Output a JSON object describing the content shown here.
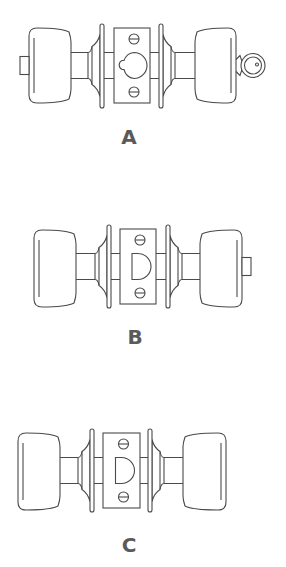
{
  "colors": {
    "background": "#ffffff",
    "line": "#4a4a4a",
    "label": "#5a5a5a"
  },
  "figures": [
    {
      "id": "A",
      "label": "A",
      "description": "keyed entry knob lockset",
      "left_accessory": "turn-button",
      "right_accessory": "key",
      "latch_hole": "round",
      "left_knob": {
        "x1": 29,
        "x2": 71,
        "top": 28,
        "bottom": 103
      },
      "left_rose": {
        "x": 100,
        "top": 24,
        "bottom": 108
      },
      "plate": {
        "x1": 114,
        "x2": 150,
        "top": 28,
        "bottom": 103
      },
      "right_rose": {
        "x": 159,
        "top": 24,
        "bottom": 108
      },
      "right_knob": {
        "x1": 195,
        "x2": 236,
        "top": 28,
        "bottom": 103
      },
      "label_pos": {
        "x": 117,
        "y": 127
      }
    },
    {
      "id": "B",
      "label": "B",
      "description": "privacy knob lockset",
      "left_accessory": "none",
      "right_accessory": "turn-button",
      "latch_hole": "d-shape",
      "left_knob": {
        "x1": 34,
        "x2": 76,
        "top": 230,
        "bottom": 307
      },
      "left_rose": {
        "x": 107,
        "top": 225,
        "bottom": 308
      },
      "plate": {
        "x1": 120,
        "x2": 156,
        "top": 229,
        "bottom": 304
      },
      "right_rose": {
        "x": 166,
        "top": 225,
        "bottom": 308
      },
      "right_knob": {
        "x1": 200,
        "x2": 242,
        "top": 230,
        "bottom": 307
      },
      "label_pos": {
        "x": 123,
        "y": 327
      }
    },
    {
      "id": "C",
      "label": "C",
      "description": "passage knob lockset",
      "left_accessory": "none",
      "right_accessory": "none",
      "latch_hole": "d-shape",
      "left_knob": {
        "x1": 18,
        "x2": 60,
        "top": 433,
        "bottom": 510
      },
      "left_rose": {
        "x": 90,
        "top": 429,
        "bottom": 512
      },
      "plate": {
        "x1": 103,
        "x2": 140,
        "top": 433,
        "bottom": 508
      },
      "right_rose": {
        "x": 148,
        "top": 429,
        "bottom": 512
      },
      "right_knob": {
        "x1": 183,
        "x2": 226,
        "top": 433,
        "bottom": 510
      },
      "label_pos": {
        "x": 117,
        "y": 535
      }
    }
  ]
}
